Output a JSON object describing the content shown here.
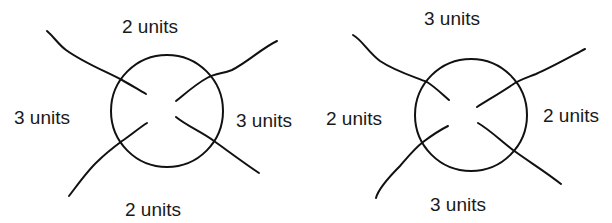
{
  "figure": {
    "diagrams": [
      {
        "id": "left",
        "circle": {
          "cx": 167,
          "cy": 111,
          "r": 56
        },
        "labels": {
          "top": "2 units",
          "left": "3 units",
          "right": "3 units",
          "bottom": "2 units"
        }
      },
      {
        "id": "right",
        "circle": {
          "cx": 471,
          "cy": 115,
          "r": 56
        },
        "labels": {
          "top": "3 units",
          "left": "2 units",
          "right": "2 units",
          "bottom": "3 units"
        }
      }
    ],
    "stroke_color": "#111111",
    "text_color": "#1a1a1a"
  }
}
